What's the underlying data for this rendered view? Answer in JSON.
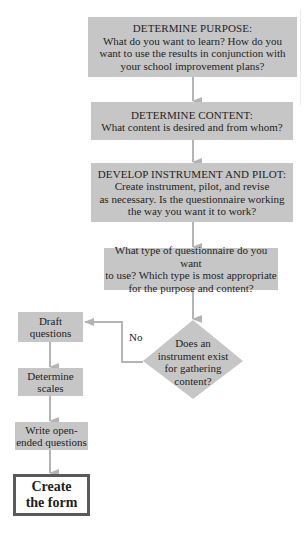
{
  "flowchart": {
    "steps": [
      {
        "heading": "DETERMINE PURPOSE:",
        "lines": [
          "What do you want to learn? How do you",
          "want to use the results in conjunction with",
          "your school improvement plans?"
        ]
      },
      {
        "heading": "DETERMINE CONTENT:",
        "lines": [
          "What content is desired and from whom?"
        ]
      },
      {
        "heading": "DEVELOP INSTRUMENT AND PILOT:",
        "lines": [
          "Create instrument, pilot, and revise",
          "as necessary. Is the questionnaire working",
          "the way you want it to work?"
        ]
      },
      {
        "heading": "",
        "lines": [
          "What type of questionnaire do you want",
          "to use? Which type is most appropriate",
          "for the purpose and content?"
        ]
      }
    ],
    "decision": {
      "lines": [
        "Does an",
        "instrument exist",
        "for gathering",
        "content?"
      ],
      "no_label": "No"
    },
    "left_steps": [
      {
        "lines": [
          "Draft",
          "questions"
        ]
      },
      {
        "lines": [
          "Determine",
          "scales"
        ]
      },
      {
        "lines": [
          "Write open-",
          "ended questions"
        ]
      }
    ],
    "final_step": {
      "lines": [
        "Create",
        "the form"
      ]
    }
  },
  "colors": {
    "box_fill": "#c6c6c6",
    "arrow": "#b4b4b4",
    "final_border": "#5a5a5a",
    "text": "#1e1e1e"
  }
}
